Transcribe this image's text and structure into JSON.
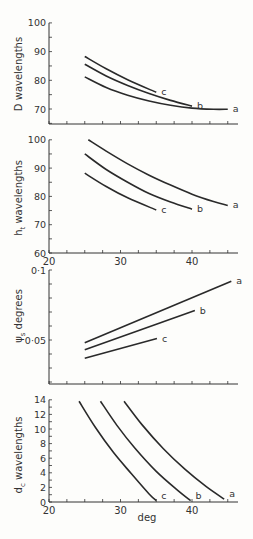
{
  "chart_data": [
    {
      "type": "line",
      "title": "",
      "xlabel": "",
      "ylabel": "D wavelengths",
      "xlim": [
        20,
        46
      ],
      "ylim": [
        65,
        100
      ],
      "yticks": [
        70,
        80,
        90,
        100
      ],
      "xticks": [],
      "grid": false,
      "series": [
        {
          "name": "a",
          "x": [
            25,
            28,
            31,
            34,
            37,
            40,
            43,
            45
          ],
          "values": [
            81.2,
            77.5,
            74.8,
            72.8,
            71.3,
            70.3,
            69.9,
            69.9
          ]
        },
        {
          "name": "b",
          "x": [
            25,
            28,
            31,
            34,
            37,
            40
          ],
          "values": [
            85.6,
            81.5,
            78.2,
            75.4,
            73.0,
            71.0
          ]
        },
        {
          "name": "c",
          "x": [
            25,
            28,
            31,
            35
          ],
          "values": [
            88.3,
            84.0,
            80.2,
            75.8
          ]
        }
      ]
    },
    {
      "type": "line",
      "title": "",
      "xlabel": "",
      "ylabel": "h_t wavelengths",
      "xlim": [
        20,
        46
      ],
      "ylim": [
        60,
        100
      ],
      "yticks": [
        60,
        70,
        80,
        90,
        100
      ],
      "xticks": [
        20,
        30,
        40
      ],
      "grid": false,
      "series": [
        {
          "name": "a",
          "x": [
            25.5,
            28,
            31,
            34,
            37,
            40,
            43,
            45
          ],
          "values": [
            100,
            96.0,
            91.5,
            87.5,
            84.0,
            80.8,
            78.2,
            76.8
          ]
        },
        {
          "name": "b",
          "x": [
            25,
            28,
            31,
            34,
            37,
            40
          ],
          "values": [
            95,
            89.5,
            85.0,
            81.0,
            78.0,
            75.5
          ]
        },
        {
          "name": "c",
          "x": [
            25,
            28,
            31,
            35
          ],
          "values": [
            88.2,
            83.5,
            79.5,
            75.2
          ]
        }
      ]
    },
    {
      "type": "line",
      "title": "",
      "xlabel": "",
      "ylabel": "ψ_s degrees",
      "xlim": [
        20,
        46
      ],
      "ylim": [
        0.02,
        0.1
      ],
      "yticks": [
        0.05,
        0.1
      ],
      "ytick_labels": [
        "0·05",
        "0·1"
      ],
      "xticks": [],
      "grid": false,
      "series": [
        {
          "name": "a",
          "x": [
            25,
            45.5
          ],
          "values": [
            0.048,
            0.092
          ]
        },
        {
          "name": "b",
          "x": [
            25,
            40.4
          ],
          "values": [
            0.043,
            0.071
          ]
        },
        {
          "name": "c",
          "x": [
            25,
            35.1
          ],
          "values": [
            0.037,
            0.051
          ]
        }
      ]
    },
    {
      "type": "line",
      "title": "",
      "xlabel": "deg",
      "ylabel": "d_c wavelengths",
      "xlim": [
        20,
        46
      ],
      "ylim": [
        0,
        14
      ],
      "yticks": [
        0,
        2,
        4,
        6,
        8,
        10,
        12,
        14
      ],
      "xticks": [
        20,
        30,
        40
      ],
      "grid": false,
      "series": [
        {
          "name": "a",
          "x": [
            30.5,
            33,
            36,
            39,
            42,
            44.5
          ],
          "values": [
            13.8,
            10.6,
            7.3,
            4.5,
            2.1,
            0.4
          ]
        },
        {
          "name": "b",
          "x": [
            27.2,
            29.5,
            32,
            35,
            38,
            39.8
          ],
          "values": [
            13.8,
            10.5,
            7.4,
            4.2,
            1.6,
            0.2
          ]
        },
        {
          "name": "c",
          "x": [
            24.2,
            26.5,
            29,
            31.5,
            34,
            35
          ],
          "values": [
            13.8,
            10.2,
            6.8,
            3.9,
            1.1,
            0.2
          ]
        }
      ]
    }
  ],
  "labels": {
    "panel1_ylabel": "D wavelengths",
    "panel2_ylabel_main": "h",
    "panel2_ylabel_sub": "t",
    "panel2_ylabel_rest": " wavelengths",
    "panel3_ylabel_main": "ψ",
    "panel3_ylabel_sub": "s",
    "panel3_ylabel_rest": " degrees",
    "panel4_ylabel_main": "d",
    "panel4_ylabel_sub": "c",
    "panel4_ylabel_rest": " wavelengths",
    "xlabel": "deg"
  }
}
